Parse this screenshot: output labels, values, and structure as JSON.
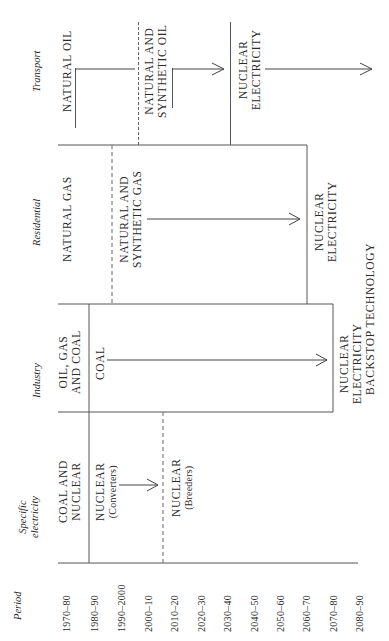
{
  "axis": {
    "period_label": "Period",
    "periods": [
      "1970–80",
      "1980–90",
      "1990–2000",
      "2000–10",
      "2010–20",
      "2020–30",
      "2030–40",
      "2040–50",
      "2050–60",
      "2060–70",
      "2070–80",
      "2080–90"
    ]
  },
  "sectors": {
    "transport": {
      "label": "Transport",
      "stages": [
        "NATURAL OIL",
        "NATURAL AND",
        "SYNTHETIC OIL",
        "NUCLEAR",
        "ELECTRICITY"
      ]
    },
    "residential": {
      "label": "Residential",
      "stages": [
        "NATURAL GAS",
        "NATURAL AND",
        "SYNTHETIC GAS",
        "NUCLEAR",
        "ELECTRICITY"
      ]
    },
    "industry": {
      "label": "Industry",
      "stages": [
        "OIL, GAS",
        "AND COAL",
        "COAL",
        "NUCLEAR",
        "ELECTRICITY"
      ]
    },
    "specific_electricity": {
      "label_line1": "Specific",
      "label_line2": "electricity",
      "stages": [
        "COAL AND",
        "NUCLEAR",
        "NUCLEAR",
        "(Converters)",
        "NUCLEAR",
        "(Breeders)"
      ]
    }
  },
  "footer": {
    "backstop": "BACKSTOP TECHNOLOGY"
  }
}
